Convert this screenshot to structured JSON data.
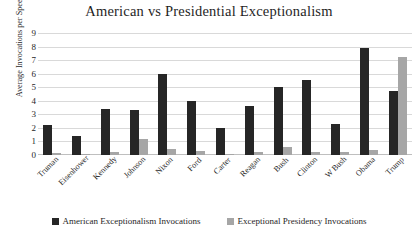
{
  "chart_data": {
    "type": "bar",
    "title": "American vs Presidential Exceptionalism",
    "xlabel": "",
    "ylabel": "Average Invocations per Speech",
    "ylim": [
      0,
      9
    ],
    "ytick_labels": [
      "9",
      "8",
      "7",
      "6",
      "5",
      "4",
      "3",
      "2",
      "1",
      "0"
    ],
    "grid": true,
    "legend_position": "bottom",
    "categories": [
      "Truman",
      "Eisenhower",
      "Kennedy",
      "Johnson",
      "Nixon",
      "Ford",
      "Carter",
      "Reagan",
      "Bush",
      "Clinton",
      "W Bush",
      "Obama",
      "Trump"
    ],
    "series": [
      {
        "name": "American Exceptionalism Invocations",
        "color": "#262626",
        "values": [
          2.2,
          1.4,
          3.4,
          3.3,
          6.0,
          4.0,
          2.0,
          3.6,
          5.0,
          5.5,
          2.3,
          7.9,
          4.7
        ]
      },
      {
        "name": "Exceptional Presidency Invocations",
        "color": "#a6a6a6",
        "values": [
          0.15,
          0.1,
          0.25,
          1.2,
          0.45,
          0.3,
          0.1,
          0.25,
          0.6,
          0.2,
          0.25,
          0.35,
          7.2
        ]
      }
    ]
  },
  "legend": {
    "items": [
      {
        "label": "American Exceptionalism Invocations"
      },
      {
        "label": "Exceptional Presidency Invocations"
      }
    ]
  }
}
